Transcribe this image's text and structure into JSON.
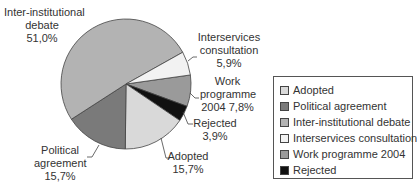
{
  "chart_data": {
    "type": "pie",
    "title": "",
    "categories": [
      "Adopted",
      "Political agreement",
      "Inter-institutional debate",
      "Interservices consultation",
      "Work programme 2004",
      "Rejected"
    ],
    "values": [
      15.7,
      15.7,
      51.0,
      5.9,
      7.8,
      3.9
    ],
    "value_labels": [
      "15,7%",
      "15,7%",
      "51,0%",
      "5,9%",
      "7,8%",
      "3,9%"
    ],
    "colors": [
      "#d9d9d9",
      "#7a7a7a",
      "#b3b3b3",
      "#f2f2f2",
      "#9a9a9a",
      "#111111"
    ],
    "legend_position": "right"
  },
  "labels": {
    "inter_l1": "Inter-institutional",
    "inter_l2": "debate",
    "inter_l3": "51,0%",
    "interserv_l1": "Interservices",
    "interserv_l2": "consultation",
    "interserv_l3": "5,9%",
    "work_l1": "Work",
    "work_l2": "programme",
    "work_l3": "2004 7,8%",
    "rejected_l1": "Rejected",
    "rejected_l2": "3,9%",
    "adopted_l1": "Adopted",
    "adopted_l2": "15,7%",
    "political_l1": "Political",
    "political_l2": "agreement",
    "political_l3": "15,7%"
  },
  "legend": {
    "items": [
      {
        "label": "Adopted",
        "color": "#d9d9d9"
      },
      {
        "label": "Political agreement",
        "color": "#7a7a7a"
      },
      {
        "label": "Inter-institutional debate",
        "color": "#b3b3b3"
      },
      {
        "label": "Interservices consultation",
        "color": "#f2f2f2"
      },
      {
        "label": "Work programme 2004",
        "color": "#9a9a9a"
      },
      {
        "label": "Rejected",
        "color": "#111111"
      }
    ]
  }
}
